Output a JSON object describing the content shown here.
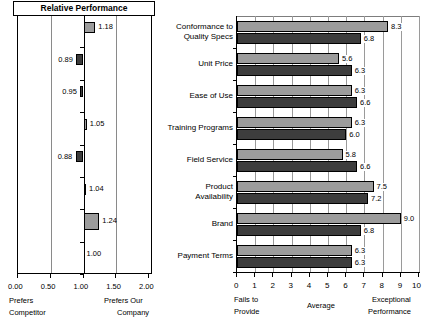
{
  "left": {
    "title": "Relative Performance",
    "axis_ticks": [
      "0.00",
      "0.50",
      "1.00",
      "1.50",
      "2.00"
    ],
    "axis_tick_values": [
      0.0,
      0.5,
      1.0,
      1.5,
      2.0
    ],
    "caption_left_line1": "Prefers",
    "caption_left_line2": "Competitor",
    "caption_right_line1": "Prefers Our",
    "caption_right_line2": "Company",
    "baseline": 1.0,
    "values": [
      "1.18",
      "0.89",
      "0.95",
      "1.05",
      "0.88",
      "1.04",
      "1.24",
      "1.00"
    ],
    "colors": {
      "above": "#9c9c9c",
      "below": "#3c3c3c"
    }
  },
  "right": {
    "categories": [
      "Conformance to\nQuality Specs",
      "Unit Price",
      "Ease of Use",
      "Training Programs",
      "Field Service",
      "Product\nAvailability",
      "Brand",
      "Payment Terms"
    ],
    "axis_ticks": [
      "0",
      "1",
      "2",
      "3",
      "4",
      "5",
      "6",
      "7",
      "8",
      "9",
      "10"
    ],
    "axis_tick_values": [
      0,
      1,
      2,
      3,
      4,
      5,
      6,
      7,
      8,
      9,
      10
    ],
    "caption_left_line1": "Fails to",
    "caption_left_line2": "Provide",
    "caption_mid": "Average",
    "caption_right_line1": "Exceptional",
    "caption_right_line2": "Performance",
    "colors": {
      "light": "#9c9c9c",
      "dark": "#3d3d3d"
    }
  },
  "chart_data": [
    {
      "type": "bar",
      "orientation": "horizontal",
      "title": "Relative Performance",
      "xlabel": "",
      "ylabel": "",
      "xlim": [
        0.0,
        2.0
      ],
      "grid": true,
      "baseline": 1.0,
      "categories": [
        "Conformance to Quality Specs",
        "Unit Price",
        "Ease of Use",
        "Training Programs",
        "Field Service",
        "Product Availability",
        "Brand",
        "Payment Terms"
      ],
      "values": [
        1.18,
        0.89,
        0.95,
        1.05,
        0.88,
        1.04,
        1.24,
        1.0
      ],
      "data_labels": [
        "1.18",
        "0.89",
        "0.95",
        "1.05",
        "0.88",
        "1.04",
        "1.24",
        "1.00"
      ],
      "xtick_labels": [
        "0.00",
        "0.50",
        "1.00",
        "1.50",
        "2.00"
      ],
      "annotations": [
        "Prefers Competitor",
        "Prefers Our Company"
      ]
    },
    {
      "type": "bar",
      "orientation": "horizontal",
      "title": "",
      "xlabel": "",
      "ylabel": "",
      "xlim": [
        0,
        10
      ],
      "grid": true,
      "categories": [
        "Conformance to Quality Specs",
        "Unit Price",
        "Ease of Use",
        "Training Programs",
        "Field Service",
        "Product Availability",
        "Brand",
        "Payment Terms"
      ],
      "series": [
        {
          "name": "Our Company",
          "color": "#9c9c9c",
          "values": [
            8.3,
            5.6,
            6.3,
            6.3,
            5.8,
            7.5,
            9.0,
            6.3
          ],
          "labels": [
            "8.3",
            "5.6",
            "6.3",
            "6.3",
            "5.8",
            "7.5",
            "9.0",
            "6.3"
          ]
        },
        {
          "name": "Competitor",
          "color": "#3d3d3d",
          "values": [
            6.8,
            6.3,
            6.6,
            6.0,
            6.6,
            7.2,
            6.8,
            6.3
          ],
          "labels": [
            "6.8",
            "6.3",
            "6.6",
            "6.0",
            "6.6",
            "7.2",
            "6.8",
            "6.3"
          ]
        }
      ],
      "xtick_labels": [
        "0",
        "1",
        "2",
        "3",
        "4",
        "5",
        "6",
        "7",
        "8",
        "9",
        "10"
      ],
      "annotations": [
        "Fails to Provide",
        "Average",
        "Exceptional Performance"
      ]
    }
  ]
}
